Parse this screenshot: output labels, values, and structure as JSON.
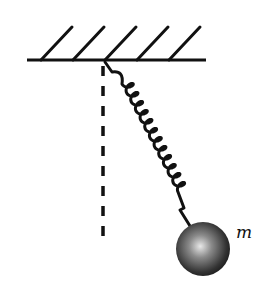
{
  "diagram": {
    "type": "spring-pendulum",
    "mass_label": "m",
    "colors": {
      "stroke": "#111111",
      "ball_highlight": "#e0e0e0",
      "ball_mid": "#6a6a6a",
      "ball_shadow": "#1a1a1a"
    },
    "ceiling": {
      "x1": 27,
      "x2": 206,
      "y": 60,
      "hatch_count": 5
    },
    "pivot": {
      "x": 104,
      "y": 61
    },
    "vertical_reference": {
      "x": 103,
      "y1": 66,
      "y2": 240,
      "style": "dashed"
    },
    "spring": {
      "coils": 12
    },
    "ball": {
      "cx": 203,
      "cy": 249,
      "r": 27
    }
  }
}
